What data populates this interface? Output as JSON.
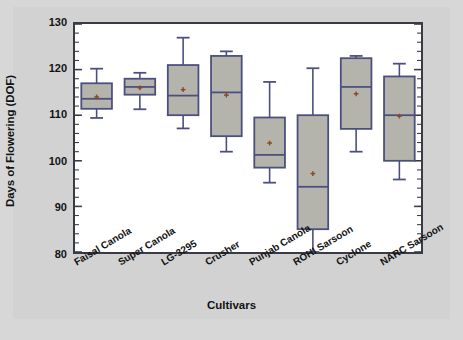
{
  "chart_data": {
    "type": "box",
    "title": "",
    "xlabel": "Cultivars",
    "ylabel": "Days of Flowering (DOF)",
    "ylim": [
      80,
      130
    ],
    "ytick_labels": [
      "130",
      "120",
      "110",
      "100",
      "90",
      "80"
    ],
    "ytick_values": [
      130,
      120,
      110,
      100,
      90,
      80
    ],
    "minor_ticks_per_interval": 5,
    "grid": false,
    "legend": "none",
    "categories": [
      "Faisal Canola",
      "Super Canola",
      "LG-3295",
      "Crusher",
      "Punjab Canola",
      "ROHI Sarsoon",
      "Cyclone",
      "NARC Sarsoon"
    ],
    "boxes": [
      {
        "name": "Faisal Canola",
        "whisker_low": 109.4,
        "q1": 111.4,
        "median": 113.6,
        "q3": 117.0,
        "whisker_high": 120.2,
        "mean": 114.0
      },
      {
        "name": "Super Canola",
        "whisker_low": 111.3,
        "q1": 114.5,
        "median": 116.2,
        "q3": 118.0,
        "whisker_high": 119.3,
        "mean": 116.0
      },
      {
        "name": "LG-3295",
        "whisker_low": 107.1,
        "q1": 110.0,
        "median": 114.3,
        "q3": 121.0,
        "whisker_high": 127.0,
        "mean": 115.6
      },
      {
        "name": "Crusher",
        "whisker_low": 102.0,
        "q1": 105.4,
        "median": 115.0,
        "q3": 123.0,
        "whisker_high": 124.0,
        "mean": 114.4
      },
      {
        "name": "Punjab Canola",
        "whisker_low": 95.2,
        "q1": 98.5,
        "median": 101.3,
        "q3": 109.5,
        "whisker_high": 117.3,
        "mean": 103.9
      },
      {
        "name": "ROHI Sarsoon",
        "whisker_low": 80.0,
        "q1": 85.0,
        "median": 94.3,
        "q3": 110.0,
        "whisker_high": 120.3,
        "mean": 97.2
      },
      {
        "name": "Cyclone",
        "whisker_low": 102.0,
        "q1": 107.0,
        "median": 116.2,
        "q3": 122.5,
        "whisker_high": 123.0,
        "mean": 114.7
      },
      {
        "name": "NARC Sarsoon",
        "whisker_low": 95.9,
        "q1": 100.0,
        "median": 110.0,
        "q3": 118.5,
        "whisker_high": 121.3,
        "mean": 109.8
      }
    ],
    "colors": {
      "box_fill": "#b4b4ac",
      "box_line": "#4a4f7e",
      "mean_marker": "#8a4a22",
      "frame": "#3b3b48",
      "plot_background": "#ffffff",
      "figure_background": "#d2d2d2",
      "page_background": "#d7d7d7"
    }
  }
}
